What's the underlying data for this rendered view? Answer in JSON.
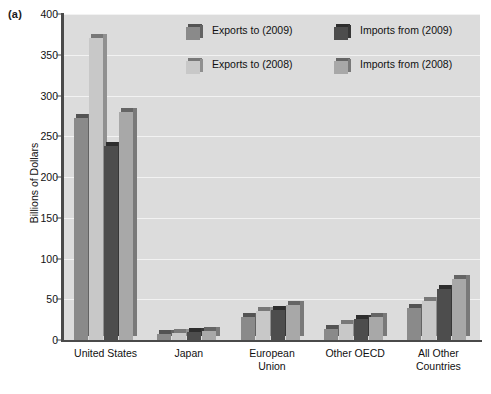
{
  "panel_label": "(a)",
  "chart_data": {
    "type": "bar",
    "title": "",
    "xlabel": "",
    "ylabel": "Billions of Dollars",
    "ylim": [
      0,
      400
    ],
    "ytick_step": 50,
    "yticks": [
      0,
      50,
      100,
      150,
      200,
      250,
      300,
      350,
      400
    ],
    "grid": true,
    "legend_position": "top-center",
    "categories": [
      "United States",
      "Japan",
      "European Union",
      "Other OECD",
      "All Other Countries"
    ],
    "series": [
      {
        "name": "Exports to (2009)",
        "color": "#8a8a8a",
        "values": [
          272,
          7,
          28,
          14,
          39
        ]
      },
      {
        "name": "Exports to (2008)",
        "color": "#c8c8c8",
        "values": [
          370,
          9,
          35,
          20,
          48
        ]
      },
      {
        "name": "Imports from (2009)",
        "color": "#4d4d4d",
        "values": [
          238,
          10,
          37,
          26,
          62
        ]
      },
      {
        "name": "Imports from (2008)",
        "color": "#a8a8a8",
        "values": [
          280,
          11,
          43,
          28,
          75
        ]
      }
    ]
  },
  "legend": {
    "entries": [
      {
        "label": "Exports to (2009)",
        "color": "#8a8a8a"
      },
      {
        "label": "Imports from (2009)",
        "color": "#4d4d4d"
      },
      {
        "label": "Exports to (2008)",
        "color": "#c8c8c8"
      },
      {
        "label": "Imports from (2008)",
        "color": "#a8a8a8"
      }
    ]
  },
  "colors": {
    "plot_background": "#dcdcdc",
    "gridline": "#f2f2f2",
    "axis": "#4a4a4a",
    "text": "#111111",
    "page_background": "#ffffff"
  }
}
